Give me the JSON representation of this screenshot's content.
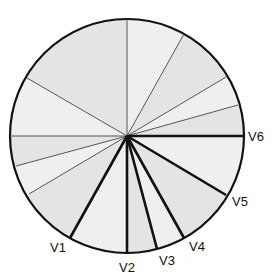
{
  "diagram": {
    "type": "precordial-lead-angle-wheel",
    "center": [
      127,
      136
    ],
    "radius": 117,
    "colors": {
      "outline": "#111111",
      "thin_line": "#555555",
      "thick_line": "#111111",
      "fill_a": "#e4e4e4",
      "fill_b": "#efefef"
    },
    "thin_lines": [
      {
        "end": [
          127,
          19
        ]
      },
      {
        "end": [
          184,
          34
        ]
      },
      {
        "end": [
          226,
          77
        ]
      },
      {
        "end": [
          238,
          105
        ]
      },
      {
        "end": [
          27,
          78
        ]
      },
      {
        "end": [
          10,
          136
        ]
      },
      {
        "end": [
          16,
          166
        ]
      },
      {
        "end": [
          29,
          194
        ]
      }
    ],
    "leads": [
      {
        "label": "V1",
        "end": [
          70,
          238
        ],
        "label_pos": [
          50,
          252
        ]
      },
      {
        "label": "V2",
        "end": [
          127,
          253
        ],
        "label_pos": [
          119,
          272
        ]
      },
      {
        "label": "V3",
        "end": [
          157,
          249
        ],
        "label_pos": [
          159,
          265
        ]
      },
      {
        "label": "V4",
        "end": [
          184,
          238
        ],
        "label_pos": [
          189,
          251
        ]
      },
      {
        "label": "V5",
        "end": [
          226,
          195
        ],
        "label_pos": [
          232,
          206
        ]
      },
      {
        "label": "V6",
        "end": [
          244,
          136
        ],
        "label_pos": [
          248,
          141
        ]
      }
    ]
  }
}
